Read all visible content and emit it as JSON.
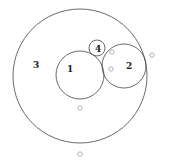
{
  "diagram": {
    "circles": [
      {
        "label": "3",
        "cx": 80,
        "cy": 76,
        "r": 67,
        "label_x": 33,
        "label_y": 68
      },
      {
        "label": "1",
        "cx": 80,
        "cy": 75,
        "r": 24,
        "label_x": 67,
        "label_y": 72
      },
      {
        "label": "2",
        "cx": 124,
        "cy": 66,
        "r": 22,
        "label_x": 126,
        "label_y": 69
      },
      {
        "label": "4",
        "cx": 97,
        "cy": 48,
        "r": 8,
        "label_x": 95,
        "label_y": 52
      }
    ],
    "markers": [
      {
        "cx": 80,
        "cy": 108
      },
      {
        "cx": 80,
        "cy": 154
      },
      {
        "cx": 112,
        "cy": 52
      },
      {
        "cx": 111,
        "cy": 69
      },
      {
        "cx": 152,
        "cy": 55
      }
    ],
    "colors": {
      "stroke": "#444444",
      "marker": "#b0b0b0"
    }
  }
}
